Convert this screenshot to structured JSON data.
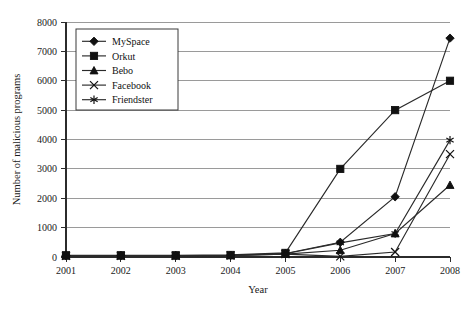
{
  "chart_data": {
    "type": "line",
    "title": "",
    "xlabel": "Year",
    "ylabel": "Number of malicious programs",
    "categories": [
      "2001",
      "2002",
      "2003",
      "2004",
      "2005",
      "2006",
      "2007",
      "2008"
    ],
    "x": [
      2001,
      2002,
      2003,
      2004,
      2005,
      2006,
      2007,
      2008
    ],
    "xlim": [
      2001,
      2008
    ],
    "ylim": [
      0,
      8000
    ],
    "ytick_labels": [
      "0",
      "1000",
      "2000",
      "3000",
      "4000",
      "5000",
      "6000",
      "7000",
      "8000"
    ],
    "yticks": [
      0,
      1000,
      2000,
      3000,
      4000,
      5000,
      6000,
      7000,
      8000
    ],
    "grid": "horizontal",
    "legend_position": "upper-left-inside",
    "series": [
      {
        "name": "MySpace",
        "marker": "diamond",
        "values": [
          50,
          50,
          50,
          60,
          120,
          500,
          2050,
          7450
        ]
      },
      {
        "name": "Orkut",
        "marker": "square",
        "values": [
          60,
          60,
          60,
          70,
          140,
          3000,
          5000,
          6000
        ]
      },
      {
        "name": "Bebo",
        "marker": "triangle",
        "values": [
          40,
          40,
          40,
          50,
          100,
          230,
          800,
          2450
        ]
      },
      {
        "name": "Facebook",
        "marker": "x-cross",
        "values": [
          40,
          40,
          40,
          50,
          100,
          20,
          170,
          3500
        ]
      },
      {
        "name": "Friendster",
        "marker": "asterisk",
        "values": [
          40,
          40,
          40,
          50,
          110,
          480,
          800,
          3980
        ]
      }
    ]
  },
  "legend": {
    "entries": [
      {
        "label": "MySpace",
        "marker": "diamond"
      },
      {
        "label": "Orkut",
        "marker": "square"
      },
      {
        "label": "Bebo",
        "marker": "triangle"
      },
      {
        "label": "Facebook",
        "marker": "x-cross"
      },
      {
        "label": "Friendster",
        "marker": "asterisk"
      }
    ]
  },
  "colors": {
    "ink": "#1a1a1a",
    "grid": "#9a9a9a",
    "background": "#ffffff"
  }
}
